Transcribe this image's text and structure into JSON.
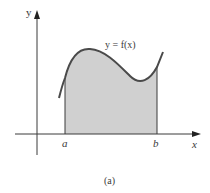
{
  "figure": {
    "caption": "(a)",
    "curve_label": "y = f(x)",
    "axes": {
      "x_label": "x",
      "y_label": "y"
    },
    "bounds": {
      "lower": "a",
      "upper": "b"
    },
    "colors": {
      "axis": "#3a3a3a",
      "curve": "#4a4a4a",
      "fill": "#d0d0d0"
    }
  }
}
